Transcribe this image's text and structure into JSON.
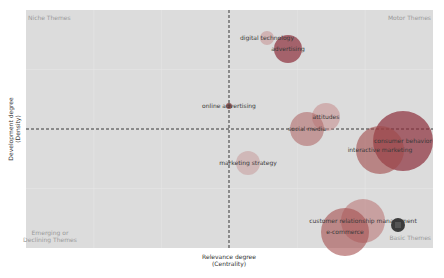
{
  "chart_data": {
    "type": "scatter",
    "subtype": "bubble / strategic thematic map",
    "title": "",
    "xlabel": "Relevance degree (Centrality)",
    "ylabel": "Development degree (Density)",
    "xlabel_lines": [
      "Relevance degree",
      "(Centrality)"
    ],
    "ylabel_lines": [
      "Development degree",
      "(Density)"
    ],
    "grid": true,
    "legend": "none",
    "quadrants": {
      "top_left": "Niche Themes",
      "top_right": "Motor Themes",
      "bottom_left": [
        "Emerging or",
        "Declining Themes"
      ],
      "bottom_right": "Basic Themes"
    },
    "reference_lines": {
      "vertical_x_px": 229,
      "horizontal_y_px": 129,
      "style": "dashed"
    },
    "plot_area_px": {
      "x0": 26,
      "y0": 10,
      "x1": 433,
      "y1": 248
    },
    "points": [
      {
        "label": "digital technology",
        "cx": 267,
        "cy": 38,
        "r": 7,
        "color": "#c48a8a",
        "opacity": 0.5
      },
      {
        "label": "advertising",
        "cx": 288,
        "cy": 49,
        "r": 14,
        "color": "#8b2e3a",
        "opacity": 0.7
      },
      {
        "label": "online advertising",
        "cx": 229,
        "cy": 106,
        "r": 3,
        "color": "#7a3a3a",
        "opacity": 0.8
      },
      {
        "label": "attitudes",
        "cx": 326,
        "cy": 117,
        "r": 14,
        "color": "#c48a8a",
        "opacity": 0.55
      },
      {
        "label": "social media",
        "cx": 307,
        "cy": 129,
        "r": 17,
        "color": "#b06a6a",
        "opacity": 0.6
      },
      {
        "label": "consumer behavior",
        "cx": 403,
        "cy": 141,
        "r": 30,
        "color": "#8b2e3a",
        "opacity": 0.7
      },
      {
        "label": "interactive marketing",
        "cx": 380,
        "cy": 150,
        "r": 24,
        "color": "#a04a4a",
        "opacity": 0.6
      },
      {
        "label": "marketing strategy",
        "cx": 248,
        "cy": 163,
        "r": 12,
        "color": "#c79a9a",
        "opacity": 0.55
      },
      {
        "label": "customer relationship management",
        "cx": 363,
        "cy": 221,
        "r": 22,
        "color": "#b87070",
        "opacity": 0.55
      },
      {
        "label": "e-commerce",
        "cx": 345,
        "cy": 232,
        "r": 24,
        "color": "#a54e4e",
        "opacity": 0.6
      },
      {
        "label": "",
        "cx": 398,
        "cy": 225,
        "r": 7,
        "color": "#2a2a2a",
        "opacity": 0.9
      }
    ]
  },
  "colors": {
    "plot_bg": "#dcdcdc",
    "gridline": "#e8e8e8",
    "reference_line": "#222222",
    "quadrant_label": "#9a9a9a"
  }
}
